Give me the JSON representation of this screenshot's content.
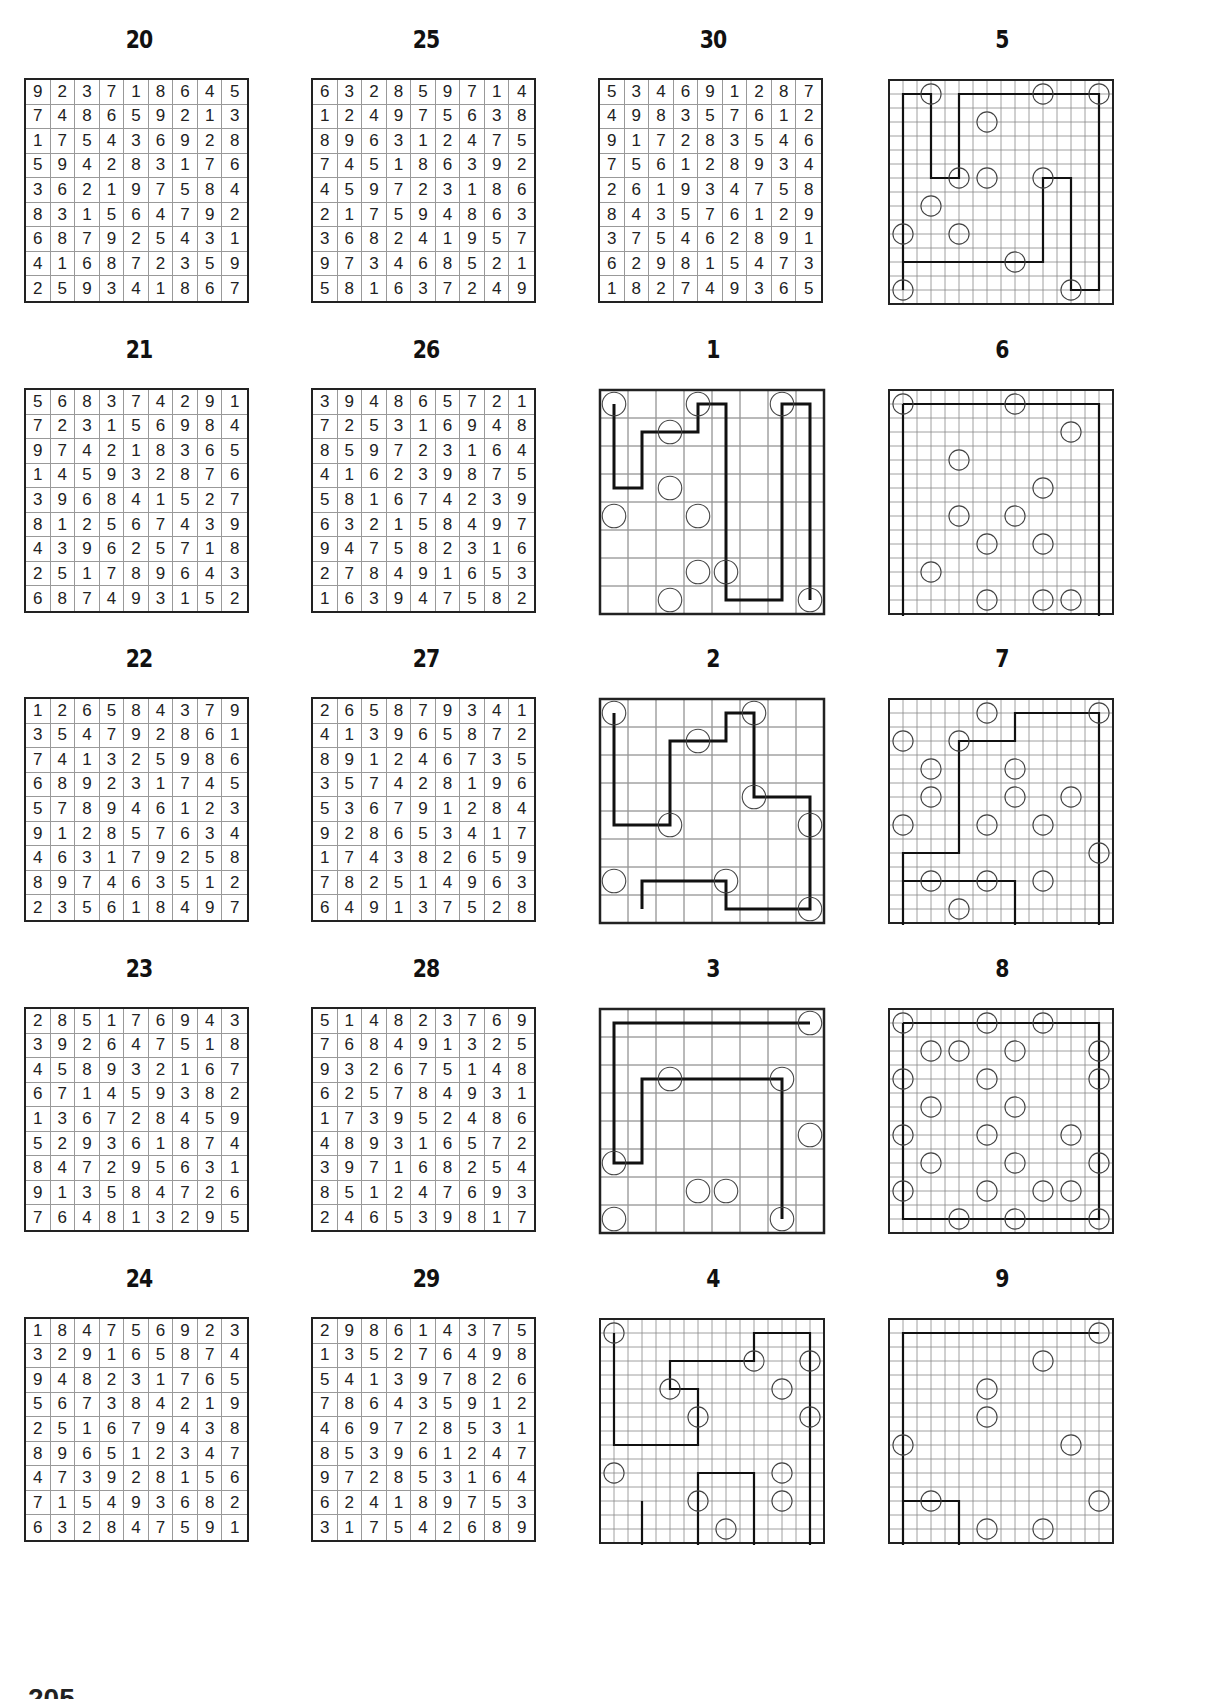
{
  "page": {
    "page_number": "205"
  },
  "sudoku": [
    {
      "title": "20",
      "x": 24,
      "y": 28,
      "rows": [
        "923718645",
        "748659213",
        "175436928",
        "594283176",
        "362197584",
        "831564792",
        "687925431",
        "416872359",
        "259341867"
      ]
    },
    {
      "title": "25",
      "x": 311,
      "y": 28,
      "rows": [
        "632859714",
        "124975638",
        "896312475",
        "745186392",
        "459723186",
        "217594863",
        "368241957",
        "973468521",
        "581637249"
      ]
    },
    {
      "title": "30",
      "x": 598,
      "y": 28,
      "rows": [
        "534691287",
        "498357612",
        "917283546",
        "756128934",
        "261934758",
        "843576129",
        "375462891",
        "629815473",
        "182749365"
      ]
    },
    {
      "title": "21",
      "x": 24,
      "y": 338,
      "rows": [
        "568374291",
        "723156984",
        "974218365",
        "145932876",
        "396841527",
        "812567439",
        "439625718",
        "251789643",
        "687493152"
      ]
    },
    {
      "title": "26",
      "x": 311,
      "y": 338,
      "rows": [
        "394865721",
        "725316948",
        "859723164",
        "416239875",
        "581674239",
        "632158497",
        "947582316",
        "278491653",
        "163947582"
      ]
    },
    {
      "title": "22",
      "x": 24,
      "y": 647,
      "rows": [
        "126584379",
        "354792861",
        "741325986",
        "689231745",
        "578946123",
        "912857634",
        "463179258",
        "897463512",
        "235618497"
      ]
    },
    {
      "title": "27",
      "x": 311,
      "y": 647,
      "rows": [
        "265879341",
        "413965872",
        "891246735",
        "357428196",
        "536791284",
        "928653417",
        "174382659",
        "782514963",
        "649137528"
      ]
    },
    {
      "title": "23",
      "x": 24,
      "y": 957,
      "rows": [
        "285176943",
        "392647518",
        "458932167",
        "671459382",
        "136728459",
        "529361874",
        "847295631",
        "913584726",
        "764813295"
      ]
    },
    {
      "title": "28",
      "x": 311,
      "y": 957,
      "rows": [
        "514823769",
        "768491325",
        "932675148",
        "625784931",
        "173952486",
        "489316572",
        "397168254",
        "851247693",
        "246539817"
      ]
    },
    {
      "title": "24",
      "x": 24,
      "y": 1267,
      "rows": [
        "184756923",
        "329165874",
        "948231765",
        "567384219",
        "251679438",
        "896512347",
        "473928156",
        "715493682",
        "632847591"
      ]
    },
    {
      "title": "29",
      "x": 311,
      "y": 1267,
      "rows": [
        "298614375",
        "135276498",
        "541397826",
        "786435912",
        "469728531",
        "853961247",
        "972853164",
        "624189753",
        "317542689"
      ]
    }
  ],
  "path_puzzles": [
    {
      "title": "5",
      "x": 887,
      "y": 28,
      "n": 10,
      "thick": false,
      "circles": [
        [
          1,
          0
        ],
        [
          5,
          0
        ],
        [
          7,
          0
        ],
        [
          3,
          1
        ],
        [
          2,
          3
        ],
        [
          3,
          3
        ],
        [
          5,
          3
        ],
        [
          1,
          4
        ],
        [
          0,
          5
        ],
        [
          2,
          5
        ],
        [
          4,
          6
        ],
        [
          0,
          7
        ],
        [
          6,
          7
        ]
      ],
      "path": [
        [
          0,
          7
        ],
        [
          0,
          0
        ],
        [
          1,
          0
        ],
        [
          1,
          3
        ],
        [
          2,
          3
        ],
        [
          2,
          0
        ],
        [
          7,
          0
        ],
        [
          7,
          7
        ],
        [
          6,
          7
        ],
        [
          6,
          3
        ],
        [
          5,
          3
        ],
        [
          5,
          6
        ],
        [
          0,
          6
        ],
        [
          0,
          7
        ]
      ]
    },
    {
      "title": "1",
      "x": 598,
      "y": 338,
      "n": 8,
      "thick": true,
      "circles": [
        [
          0,
          0
        ],
        [
          3,
          0
        ],
        [
          6,
          0
        ],
        [
          2,
          1
        ],
        [
          2,
          3
        ],
        [
          0,
          4
        ],
        [
          3,
          4
        ],
        [
          3,
          6
        ],
        [
          4,
          6
        ],
        [
          2,
          7
        ],
        [
          7,
          7
        ]
      ],
      "path": [
        [
          0,
          0
        ],
        [
          0,
          3
        ],
        [
          1,
          3
        ],
        [
          1,
          1
        ],
        [
          3,
          1
        ],
        [
          3,
          0
        ],
        [
          4,
          0
        ],
        [
          4,
          7
        ],
        [
          6,
          7
        ],
        [
          6,
          0
        ],
        [
          7,
          0
        ],
        [
          7,
          7
        ]
      ]
    },
    {
      "title": "6",
      "x": 887,
      "y": 338,
      "n": 10,
      "thick": false,
      "circles": [
        [
          0,
          0
        ],
        [
          4,
          0
        ],
        [
          6,
          1
        ],
        [
          2,
          2
        ],
        [
          5,
          3
        ],
        [
          2,
          4
        ],
        [
          4,
          4
        ],
        [
          3,
          5
        ],
        [
          5,
          5
        ],
        [
          1,
          6
        ],
        [
          3,
          7
        ],
        [
          5,
          7
        ],
        [
          6,
          7
        ],
        [
          2,
          8
        ],
        [
          4,
          8
        ],
        [
          7,
          8
        ]
      ],
      "path": [
        [
          0,
          0
        ],
        [
          7,
          0
        ],
        [
          7,
          8
        ],
        [
          0,
          8
        ],
        [
          0,
          0
        ]
      ]
    },
    {
      "title": "2",
      "x": 598,
      "y": 647,
      "n": 8,
      "thick": true,
      "circles": [
        [
          0,
          0
        ],
        [
          5,
          0
        ],
        [
          3,
          1
        ],
        [
          2,
          4
        ],
        [
          5,
          3
        ],
        [
          7,
          4
        ],
        [
          0,
          6
        ],
        [
          4,
          6
        ],
        [
          7,
          7
        ]
      ],
      "path": [
        [
          0,
          0
        ],
        [
          0,
          4
        ],
        [
          2,
          4
        ],
        [
          2,
          1
        ],
        [
          4,
          1
        ],
        [
          4,
          0
        ],
        [
          5,
          0
        ],
        [
          5,
          3
        ],
        [
          7,
          3
        ],
        [
          7,
          7
        ],
        [
          4,
          7
        ],
        [
          4,
          6
        ],
        [
          1,
          6
        ],
        [
          1,
          7
        ]
      ]
    },
    {
      "title": "7",
      "x": 887,
      "y": 647,
      "n": 10,
      "thick": false,
      "circles": [
        [
          7,
          0
        ],
        [
          3,
          0
        ],
        [
          0,
          1
        ],
        [
          2,
          1
        ],
        [
          1,
          2
        ],
        [
          4,
          2
        ],
        [
          1,
          3
        ],
        [
          4,
          3
        ],
        [
          6,
          3
        ],
        [
          0,
          4
        ],
        [
          3,
          4
        ],
        [
          5,
          4
        ],
        [
          7,
          5
        ],
        [
          1,
          6
        ],
        [
          3,
          6
        ],
        [
          5,
          6
        ],
        [
          2,
          7
        ],
        [
          0,
          8
        ],
        [
          5,
          8
        ],
        [
          7,
          8
        ]
      ],
      "path": [
        [
          0,
          8
        ],
        [
          0,
          5
        ],
        [
          2,
          5
        ],
        [
          2,
          1
        ],
        [
          4,
          1
        ],
        [
          4,
          0
        ],
        [
          7,
          0
        ],
        [
          7,
          8
        ],
        [
          4,
          8
        ],
        [
          4,
          6
        ],
        [
          0,
          6
        ]
      ]
    },
    {
      "title": "3",
      "x": 598,
      "y": 957,
      "n": 8,
      "thick": true,
      "circles": [
        [
          7,
          0
        ],
        [
          2,
          2
        ],
        [
          6,
          2
        ],
        [
          7,
          4
        ],
        [
          0,
          5
        ],
        [
          3,
          6
        ],
        [
          4,
          6
        ],
        [
          0,
          7
        ],
        [
          6,
          7
        ]
      ],
      "path": [
        [
          7,
          0
        ],
        [
          0,
          0
        ],
        [
          0,
          5
        ],
        [
          1,
          5
        ],
        [
          1,
          2
        ],
        [
          6,
          2
        ],
        [
          6,
          7
        ]
      ]
    },
    {
      "title": "8",
      "x": 887,
      "y": 957,
      "n": 10,
      "thick": false,
      "circles": [
        [
          0,
          0
        ],
        [
          3,
          0
        ],
        [
          5,
          0
        ],
        [
          1,
          1
        ],
        [
          2,
          1
        ],
        [
          4,
          1
        ],
        [
          7,
          1
        ],
        [
          0,
          2
        ],
        [
          3,
          2
        ],
        [
          7,
          2
        ],
        [
          1,
          3
        ],
        [
          4,
          3
        ],
        [
          0,
          4
        ],
        [
          3,
          4
        ],
        [
          6,
          4
        ],
        [
          1,
          5
        ],
        [
          4,
          5
        ],
        [
          7,
          5
        ],
        [
          0,
          6
        ],
        [
          3,
          6
        ],
        [
          5,
          6
        ],
        [
          6,
          6
        ],
        [
          2,
          7
        ],
        [
          4,
          7
        ],
        [
          7,
          7
        ]
      ],
      "path": [
        [
          0,
          0
        ],
        [
          7,
          0
        ],
        [
          7,
          7
        ],
        [
          0,
          7
        ],
        [
          0,
          0
        ]
      ]
    },
    {
      "title": "4",
      "x": 598,
      "y": 1267,
      "n": 10,
      "thick": false,
      "circles": [
        [
          0,
          0
        ],
        [
          5,
          1
        ],
        [
          7,
          1
        ],
        [
          2,
          2
        ],
        [
          3,
          3
        ],
        [
          6,
          2
        ],
        [
          7,
          3
        ],
        [
          0,
          5
        ],
        [
          6,
          5
        ],
        [
          3,
          6
        ],
        [
          6,
          6
        ],
        [
          4,
          7
        ],
        [
          1,
          8
        ],
        [
          5,
          8
        ],
        [
          7,
          8
        ]
      ],
      "path": [
        [
          0,
          0
        ],
        [
          0,
          4
        ],
        [
          3,
          4
        ],
        [
          3,
          2
        ],
        [
          2,
          2
        ],
        [
          2,
          1
        ],
        [
          5,
          1
        ],
        [
          5,
          0
        ],
        [
          7,
          0
        ],
        [
          7,
          8
        ],
        [
          5,
          8
        ],
        [
          5,
          5
        ],
        [
          3,
          5
        ],
        [
          3,
          8
        ],
        [
          1,
          8
        ],
        [
          1,
          6
        ]
      ]
    },
    {
      "title": "9",
      "x": 887,
      "y": 1267,
      "n": 10,
      "thick": false,
      "circles": [
        [
          7,
          0
        ],
        [
          5,
          1
        ],
        [
          3,
          2
        ],
        [
          3,
          3
        ],
        [
          0,
          4
        ],
        [
          6,
          4
        ],
        [
          1,
          6
        ],
        [
          7,
          6
        ],
        [
          3,
          7
        ],
        [
          5,
          7
        ],
        [
          0,
          8
        ],
        [
          2,
          8
        ],
        [
          6,
          8
        ]
      ],
      "path": [
        [
          7,
          0
        ],
        [
          0,
          0
        ],
        [
          0,
          8
        ],
        [
          2,
          8
        ],
        [
          2,
          6
        ],
        [
          0,
          6
        ]
      ]
    }
  ]
}
